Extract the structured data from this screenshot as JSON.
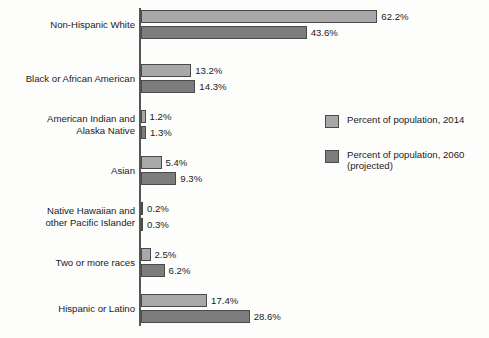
{
  "chart_data": {
    "type": "bar",
    "orientation": "horizontal",
    "title": "",
    "subtitle": "",
    "xlabel": "",
    "ylabel": "",
    "grid": false,
    "xlim": [
      0,
      65
    ],
    "axis_unit": "%",
    "legend_position": "right",
    "categories": [
      "Non-Hispanic White",
      "Black or African American",
      "American Indian and\nAlaska Native",
      "Asian",
      "Native Hawaiian and\nother Pacific Islander",
      "Two or more races",
      "Hispanic or Latino"
    ],
    "series": [
      {
        "name": "Percent of population, 2014",
        "color": "#a8a8a8",
        "values": [
          62.2,
          13.2,
          1.2,
          5.4,
          0.2,
          2.5,
          17.4
        ],
        "labels": [
          "62.2%",
          "13.2%",
          "1.2%",
          "5.4%",
          "0.2%",
          "2.5%",
          "17.4%"
        ]
      },
      {
        "name": "Percent of population, 2060\n(projected)",
        "color": "#7d7d7d",
        "values": [
          43.6,
          14.3,
          1.3,
          9.3,
          0.3,
          6.2,
          28.6
        ],
        "labels": [
          "43.6%",
          "14.3%",
          "1.3%",
          "9.3%",
          "0.3%",
          "6.2%",
          "28.6%"
        ]
      }
    ]
  },
  "legend": {
    "items": [
      {
        "label": "Percent of population, 2014",
        "color": "#a8a8a8"
      },
      {
        "label": "Percent of population, 2060\n(projected)",
        "color": "#7d7d7d"
      }
    ]
  },
  "colors": {
    "series_2014": "#a8a8a8",
    "series_2060": "#7d7d7d",
    "axis": "#555555",
    "text": "#1b1b1b",
    "background": "#fdfdfc"
  }
}
